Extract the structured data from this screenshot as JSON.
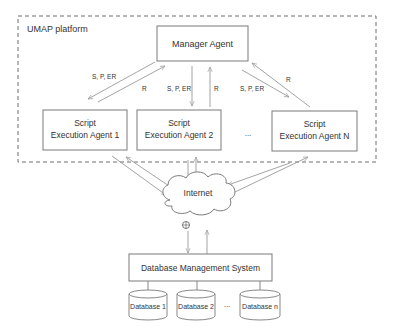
{
  "diagram": {
    "platform": {
      "label": "UMAP platform"
    },
    "manager": {
      "label": "Manager Agent"
    },
    "agents": [
      {
        "line1": "Script",
        "line2": "Execution Agent 1"
      },
      {
        "line1": "Script",
        "line2": "Execution Agent 2"
      },
      {
        "line1": "Script",
        "line2": "Execution Agent N"
      }
    ],
    "agent_ellipsis": "...",
    "edge_labels": {
      "left_down": "S, P, ER",
      "left_up": "R",
      "mid_down": "S, P, ER",
      "mid_up": "R",
      "right_down": "S, P, ER",
      "right_up": "R"
    },
    "internet": {
      "label": "Internet"
    },
    "dbms": {
      "label": "Database Management System"
    },
    "databases": [
      {
        "label": "Database 1"
      },
      {
        "label": "Database 2"
      },
      {
        "label": "Database n"
      }
    ],
    "db_ellipsis": "..."
  }
}
